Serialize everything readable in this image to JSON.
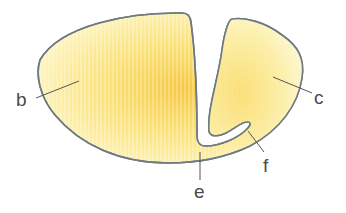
{
  "diagram": {
    "type": "anatomical-section",
    "colors": {
      "outline": "#6e7a80",
      "fill_center": "#f5c842",
      "fill_mid": "#fbe27a",
      "fill_edge": "#fdf6c8",
      "label": "#4a4a4a"
    },
    "labels": [
      {
        "id": "b",
        "text": "b"
      },
      {
        "id": "c",
        "text": "c"
      },
      {
        "id": "e",
        "text": "e"
      },
      {
        "id": "f",
        "text": "f"
      }
    ]
  }
}
